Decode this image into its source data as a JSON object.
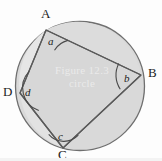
{
  "figure": {
    "colors": {
      "background": "#fdfdfd",
      "circle_fill": "#d8d8d8",
      "circle_stroke": "#6f6f6f",
      "chord_stroke": "#5a5a5a",
      "arc_stroke": "#4a4a4a",
      "label_color": "#1c1c1c",
      "watermark_color": "#eeeeee"
    },
    "circle": {
      "center_x": 80,
      "center_y": 86,
      "radius": 65
    },
    "vertices": [
      {
        "name": "A",
        "label": "A",
        "x": 46,
        "y": 30,
        "label_x": 41,
        "label_y": 7
      },
      {
        "name": "B",
        "label": "B",
        "x": 141,
        "y": 75,
        "label_x": 148,
        "label_y": 66
      },
      {
        "name": "C",
        "label": "C",
        "x": 63,
        "y": 148,
        "label_x": 58,
        "label_y": 148
      },
      {
        "name": "D",
        "label": "D",
        "x": 20,
        "y": 93,
        "label_x": 3,
        "label_y": 85
      }
    ],
    "angles": [
      {
        "name": "a",
        "label": "a",
        "at_vertex": "A",
        "label_x": 48,
        "label_y": 36
      },
      {
        "name": "b",
        "label": "b",
        "at_vertex": "B",
        "label_x": 124,
        "label_y": 74
      },
      {
        "name": "c",
        "label": "c",
        "at_vertex": "C",
        "label_x": 58,
        "label_y": 131
      },
      {
        "name": "d",
        "label": "d",
        "at_vertex": "D",
        "label_x": 25,
        "label_y": 88
      }
    ],
    "edges": [
      {
        "name": "AB",
        "from": "A",
        "to": "B"
      },
      {
        "name": "BC",
        "from": "B",
        "to": "C"
      },
      {
        "name": "CD",
        "from": "C",
        "to": "D"
      },
      {
        "name": "DA",
        "from": "D",
        "to": "A"
      }
    ],
    "watermark": {
      "line1": "Figure 12.3",
      "line2": "circle"
    }
  }
}
